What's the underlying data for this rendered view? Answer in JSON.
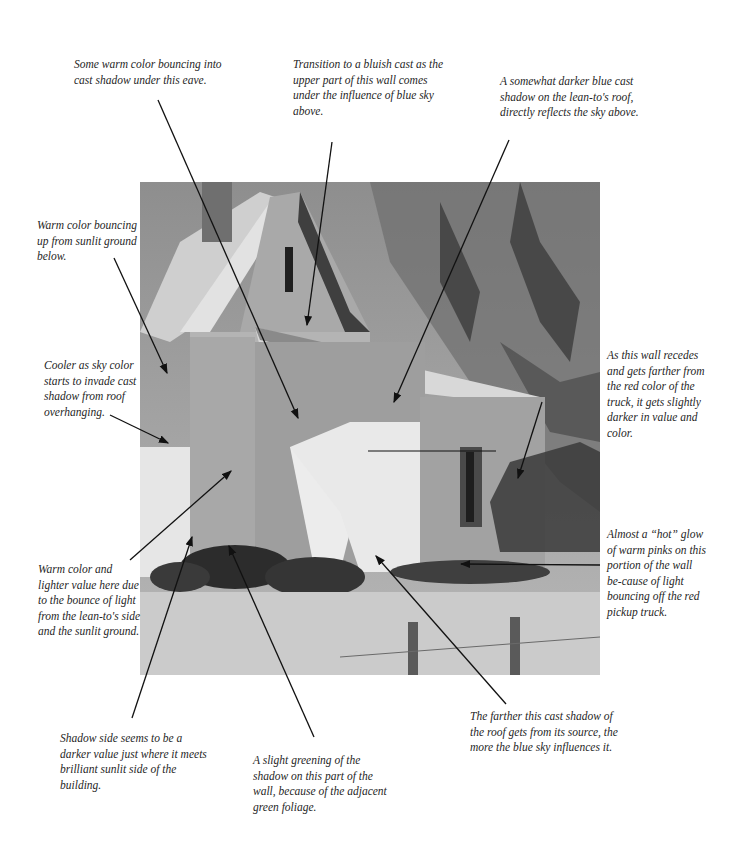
{
  "painting": {
    "subject": "Watercolor of a clapboard farmhouse with lean-to, chimney, tree, foliage and fence"
  },
  "annotations": [
    {
      "id": "warm-eave",
      "text": "Some warm color bouncing into cast shadow under this eave."
    },
    {
      "id": "bluish-cast",
      "text": "Transition to a bluish cast as the upper part of this wall comes under the influence of blue sky above."
    },
    {
      "id": "lean-to-roof",
      "text": "A somewhat darker blue cast shadow on the lean-to's roof, directly reflects the sky above."
    },
    {
      "id": "warm-up",
      "text": "Warm color bouncing up from sunlit ground below."
    },
    {
      "id": "cooler",
      "text": "Cooler as sky color starts to invade cast shadow from roof overhanging."
    },
    {
      "id": "recedes",
      "text": "As this wall recedes and gets farther from the red color of the truck, it gets slightly darker in value and color."
    },
    {
      "id": "hot-glow",
      "text": "Almost a “hot” glow of warm pinks on this portion of the wall be-cause of light bouncing off the red pickup truck."
    },
    {
      "id": "warm-lighter",
      "text": "Warm color and lighter value here due to the bounce of light from the lean-to's side and the sunlit ground."
    },
    {
      "id": "shadow-side",
      "text": "Shadow side seems to be a darker value just where it meets brilliant sunlit side of the building."
    },
    {
      "id": "greening",
      "text": "A slight greening of the shadow on this part of the wall, because of the adjacent green foliage."
    },
    {
      "id": "farther-shadow",
      "text": "The farther this cast shadow of the roof gets from its source, the more the blue sky influences it."
    }
  ]
}
